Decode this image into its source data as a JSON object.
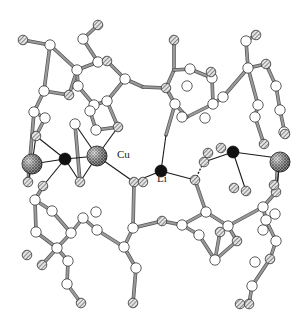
{
  "diagram": {
    "type": "ball-and-stick molecular crystal structure",
    "labels": [
      {
        "text": "Cu",
        "x": 117,
        "y": 158
      },
      {
        "text": "Li",
        "x": 157,
        "y": 182
      }
    ],
    "legend_styles": {
      "carbon": "open white sphere",
      "heteroatom": "hatched grey sphere",
      "copper": "large crosshatched sphere",
      "lithium": "solid black sphere"
    },
    "colors": {
      "bond": "#9a9a9a",
      "metal_bond": "#1a1a1a",
      "carbon_fill": "#ffffff",
      "hetero_fill": "#bdbdbd",
      "cu_fill": "#8a8a8a",
      "li_fill": "#111111",
      "outline": "#333333"
    }
  },
  "atoms": {
    "C": [
      [
        50,
        45
      ],
      [
        83,
        39
      ],
      [
        98,
        62
      ],
      [
        77,
        70
      ],
      [
        44,
        91
      ],
      [
        78,
        86
      ],
      [
        94,
        105
      ],
      [
        107,
        101
      ],
      [
        90,
        111
      ],
      [
        34,
        112
      ],
      [
        45,
        118
      ],
      [
        96,
        130
      ],
      [
        75,
        124
      ],
      [
        190,
        69
      ],
      [
        212,
        78
      ],
      [
        187,
        86
      ],
      [
        175,
        104
      ],
      [
        213,
        104
      ],
      [
        182,
        117
      ],
      [
        246,
        41
      ],
      [
        248,
        68
      ],
      [
        276,
        86
      ],
      [
        280,
        110
      ],
      [
        258,
        105
      ],
      [
        223,
        97
      ],
      [
        255,
        117
      ],
      [
        284,
        132
      ],
      [
        125,
        79
      ],
      [
        205,
        118
      ],
      [
        35,
        200
      ],
      [
        52,
        211
      ],
      [
        36,
        232
      ],
      [
        71,
        233
      ],
      [
        57,
        248
      ],
      [
        68,
        261
      ],
      [
        67,
        284
      ],
      [
        96,
        212
      ],
      [
        83,
        218
      ],
      [
        133,
        228
      ],
      [
        124,
        247
      ],
      [
        136,
        268
      ],
      [
        182,
        225
      ],
      [
        206,
        212
      ],
      [
        199,
        235
      ],
      [
        215,
        260
      ],
      [
        228,
        226
      ],
      [
        263,
        207
      ],
      [
        275,
        214
      ],
      [
        263,
        230
      ],
      [
        276,
        241
      ],
      [
        255,
        262
      ],
      [
        252,
        286
      ],
      [
        266,
        220
      ],
      [
        97,
        230
      ]
    ],
    "X": [
      [
        23,
        40
      ],
      [
        98,
        25
      ],
      [
        174,
        40
      ],
      [
        107,
        61
      ],
      [
        69,
        95
      ],
      [
        256,
        35
      ],
      [
        266,
        64
      ],
      [
        36,
        136
      ],
      [
        118,
        127
      ],
      [
        211,
        72
      ],
      [
        166,
        88
      ],
      [
        264,
        144
      ],
      [
        285,
        134
      ],
      [
        28,
        182
      ],
      [
        43,
        186
      ],
      [
        80,
        182
      ],
      [
        42,
        265
      ],
      [
        27,
        255
      ],
      [
        81,
        303
      ],
      [
        133,
        303
      ],
      [
        162,
        221
      ],
      [
        134,
        182
      ],
      [
        195,
        180
      ],
      [
        234,
        188
      ],
      [
        237,
        241
      ],
      [
        270,
        259
      ],
      [
        249,
        304
      ],
      [
        240,
        304
      ],
      [
        208,
        153
      ],
      [
        221,
        148
      ],
      [
        204,
        162
      ],
      [
        276,
        192
      ],
      [
        274,
        185
      ],
      [
        278,
        158
      ],
      [
        246,
        191
      ],
      [
        143,
        182
      ],
      [
        220,
        232
      ]
    ],
    "Cu": [
      [
        32,
        164
      ],
      [
        97,
        156
      ],
      [
        280,
        162
      ]
    ],
    "Li": [
      [
        65,
        159
      ],
      [
        161,
        171
      ],
      [
        233,
        152
      ]
    ]
  },
  "bonds": {
    "organic": [
      [
        23,
        40,
        50,
        45
      ],
      [
        50,
        45,
        77,
        70
      ],
      [
        77,
        70,
        98,
        62
      ],
      [
        83,
        39,
        98,
        25
      ],
      [
        83,
        39,
        98,
        62
      ],
      [
        50,
        45,
        44,
        91
      ],
      [
        44,
        91,
        34,
        112
      ],
      [
        34,
        112,
        45,
        118
      ],
      [
        45,
        118,
        36,
        136
      ],
      [
        44,
        91,
        69,
        95
      ],
      [
        69,
        95,
        77,
        70
      ],
      [
        77,
        70,
        78,
        86
      ],
      [
        78,
        86,
        94,
        105
      ],
      [
        94,
        105,
        107,
        101
      ],
      [
        107,
        101,
        125,
        79
      ],
      [
        125,
        79,
        107,
        61
      ],
      [
        107,
        61,
        98,
        62
      ],
      [
        125,
        79,
        143,
        87
      ],
      [
        143,
        87,
        166,
        88
      ],
      [
        166,
        88,
        174,
        70
      ],
      [
        174,
        70,
        174,
        40
      ],
      [
        174,
        70,
        190,
        69
      ],
      [
        190,
        69,
        212,
        78
      ],
      [
        212,
        78,
        213,
        104
      ],
      [
        213,
        104,
        187,
        117
      ],
      [
        187,
        117,
        175,
        104
      ],
      [
        175,
        104,
        166,
        88
      ],
      [
        175,
        104,
        166,
        135
      ],
      [
        213,
        104,
        223,
        97
      ],
      [
        223,
        97,
        248,
        68
      ],
      [
        248,
        68,
        246,
        41
      ],
      [
        246,
        41,
        256,
        35
      ],
      [
        248,
        68,
        266,
        64
      ],
      [
        266,
        64,
        276,
        86
      ],
      [
        276,
        86,
        280,
        110
      ],
      [
        280,
        110,
        285,
        134
      ],
      [
        248,
        68,
        258,
        105
      ],
      [
        258,
        105,
        255,
        117
      ],
      [
        255,
        117,
        264,
        144
      ],
      [
        94,
        105,
        90,
        111
      ],
      [
        90,
        111,
        96,
        130
      ],
      [
        96,
        130,
        118,
        127
      ],
      [
        107,
        101,
        118,
        127
      ],
      [
        75,
        124,
        80,
        182
      ],
      [
        34,
        112,
        28,
        182
      ],
      [
        36,
        232,
        35,
        200
      ],
      [
        35,
        200,
        43,
        186
      ],
      [
        36,
        232,
        57,
        248
      ],
      [
        57,
        248,
        68,
        261
      ],
      [
        68,
        261,
        67,
        284
      ],
      [
        67,
        284,
        81,
        303
      ],
      [
        57,
        248,
        71,
        233
      ],
      [
        71,
        233,
        83,
        218
      ],
      [
        83,
        218,
        97,
        230
      ],
      [
        97,
        230,
        124,
        247
      ],
      [
        124,
        247,
        136,
        268
      ],
      [
        136,
        268,
        133,
        303
      ],
      [
        124,
        247,
        133,
        228
      ],
      [
        133,
        228,
        134,
        182
      ],
      [
        133,
        228,
        162,
        221
      ],
      [
        162,
        221,
        182,
        225
      ],
      [
        182,
        225,
        206,
        212
      ],
      [
        206,
        212,
        195,
        180
      ],
      [
        182,
        225,
        199,
        235
      ],
      [
        199,
        235,
        215,
        260
      ],
      [
        215,
        260,
        237,
        241
      ],
      [
        237,
        241,
        228,
        226
      ],
      [
        228,
        226,
        206,
        212
      ],
      [
        228,
        226,
        263,
        207
      ],
      [
        263,
        207,
        276,
        192
      ],
      [
        276,
        192,
        278,
        158
      ],
      [
        263,
        207,
        266,
        220
      ],
      [
        266,
        220,
        276,
        241
      ],
      [
        276,
        241,
        270,
        259
      ],
      [
        270,
        259,
        252,
        286
      ],
      [
        252,
        286,
        249,
        304
      ],
      [
        215,
        260,
        220,
        232
      ],
      [
        42,
        265,
        57,
        248
      ],
      [
        52,
        211,
        35,
        200
      ],
      [
        52,
        211,
        71,
        233
      ]
    ],
    "metal": [
      [
        32,
        164,
        36,
        136
      ],
      [
        32,
        164,
        28,
        182
      ],
      [
        65,
        159,
        32,
        164
      ],
      [
        65,
        159,
        36,
        136
      ],
      [
        65,
        159,
        43,
        186
      ],
      [
        65,
        159,
        97,
        156
      ],
      [
        65,
        159,
        80,
        182
      ],
      [
        97,
        156,
        80,
        182
      ],
      [
        97,
        156,
        118,
        127
      ],
      [
        97,
        156,
        134,
        182
      ],
      [
        97,
        156,
        75,
        124
      ],
      [
        134,
        182,
        161,
        171
      ],
      [
        161,
        171,
        166,
        135
      ],
      [
        161,
        171,
        195,
        180
      ],
      [
        233,
        152,
        204,
        162
      ],
      [
        233,
        152,
        278,
        158
      ],
      [
        233,
        152,
        246,
        191
      ],
      [
        280,
        162,
        278,
        158
      ],
      [
        280,
        162,
        276,
        192
      ]
    ],
    "dashed": [
      [
        195,
        180,
        208,
        153
      ]
    ]
  }
}
